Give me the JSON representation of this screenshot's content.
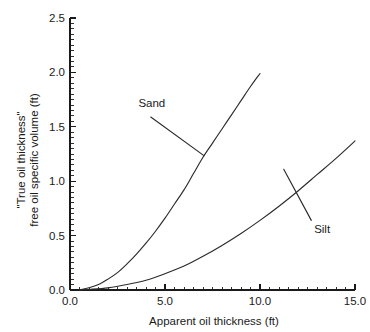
{
  "chart_data": {
    "type": "line",
    "title": "",
    "xlabel": "Apparent oil thickness (ft)",
    "ylabel_line1": "\"True oil thickness\"",
    "ylabel_line2": "free oil specific volume (ft)",
    "xlim": [
      0.0,
      15.0
    ],
    "ylim": [
      0.0,
      2.5
    ],
    "xticks": [
      "0.0",
      "5.0",
      "10.0",
      "15.0"
    ],
    "xtick_values": [
      0.0,
      5.0,
      10.0,
      15.0
    ],
    "yticks": [
      "0.0",
      "0.5",
      "1.0",
      "1.5",
      "2.0",
      "2.5"
    ],
    "ytick_values": [
      0.0,
      0.5,
      1.0,
      1.5,
      2.0,
      2.5
    ],
    "x_minor_interval": 0.5,
    "y_minor_interval": 0.05,
    "grid": false,
    "legend_position": "inline-annotations",
    "line_color": "#2b2b2b",
    "series": [
      {
        "name": "Sand",
        "x": [
          0.5,
          1.0,
          1.5,
          2.0,
          2.5,
          3.0,
          3.5,
          4.0,
          4.5,
          5.0,
          5.5,
          6.0,
          6.5,
          7.0,
          7.5,
          8.0,
          8.5,
          9.0,
          9.5,
          10.0
        ],
        "values": [
          0.0,
          0.02,
          0.05,
          0.1,
          0.16,
          0.24,
          0.33,
          0.43,
          0.54,
          0.66,
          0.79,
          0.92,
          1.07,
          1.22,
          1.35,
          1.48,
          1.61,
          1.74,
          1.87,
          1.99
        ],
        "label_x": 3.6,
        "label_y": 1.68,
        "leader_from_x": 4.25,
        "leader_from_y": 1.59,
        "leader_to_x": 7.05,
        "leader_to_y": 1.235
      },
      {
        "name": "Silt",
        "x": [
          0.5,
          1.0,
          2.0,
          3.0,
          4.0,
          5.0,
          6.0,
          7.0,
          8.0,
          9.0,
          10.0,
          11.0,
          12.0,
          13.0,
          14.0,
          15.0
        ],
        "values": [
          0.0,
          0.005,
          0.02,
          0.05,
          0.09,
          0.15,
          0.22,
          0.31,
          0.41,
          0.52,
          0.64,
          0.77,
          0.91,
          1.06,
          1.21,
          1.37
        ],
        "label_x": 12.85,
        "label_y": 0.525,
        "leader_from_x": 12.7,
        "leader_from_y": 0.64,
        "leader_to_x": 11.25,
        "leader_to_y": 1.11
      }
    ]
  }
}
